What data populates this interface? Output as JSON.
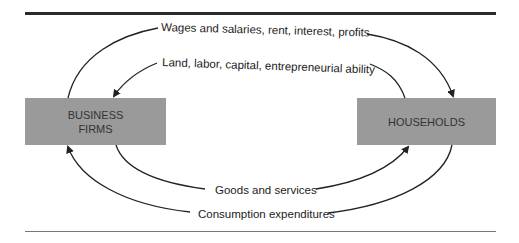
{
  "diagram": {
    "nodes": {
      "firms": {
        "line1": "BUSINESS",
        "line2": "FIRMS"
      },
      "households": {
        "label": "HOUSEHOLDS"
      }
    },
    "flows": {
      "income": "Wages and salaries, rent, interest, profits",
      "resources": "Land, labor, capital, entrepreneurial ability",
      "goods": "Goods and services",
      "expenditures": "Consumption expenditures"
    },
    "colors": {
      "box_fill": "#9a9a9a",
      "line": "#222222"
    }
  }
}
